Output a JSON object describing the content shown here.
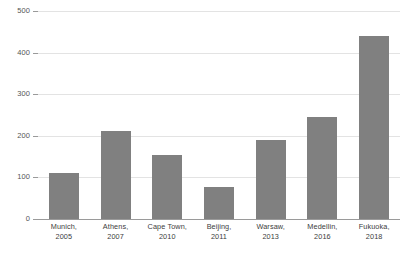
{
  "chart_data": {
    "type": "bar",
    "title": "",
    "subtitle": "",
    "xlabel": "",
    "ylabel": "",
    "ylim": [
      0,
      500
    ],
    "yticks": [
      0,
      100,
      200,
      300,
      400,
      500
    ],
    "ytick_labels": [
      "0",
      "100",
      "200",
      "300",
      "400",
      "500"
    ],
    "grid": true,
    "legend": false,
    "legend_position": "none",
    "bar_color": "#808080",
    "gridline_color": "#e3e3e3",
    "axis_color": "#9a9a9a",
    "categories": [
      "Munich, 2005",
      "Athens, 2007",
      "Cape Town, 2010",
      "Beijing, 2011",
      "Warsaw, 2013",
      "Medellin, 2016",
      "Fukuoka, 2018"
    ],
    "category_lines": [
      [
        "Munich,",
        "2005"
      ],
      [
        "Athens,",
        "2007"
      ],
      [
        "Cape Town,",
        "2010"
      ],
      [
        "Beijing,",
        "2011"
      ],
      [
        "Warsaw,",
        "2013"
      ],
      [
        "Medellin,",
        "2016"
      ],
      [
        "Fukuoka,",
        "2018"
      ]
    ],
    "values": [
      110,
      212,
      153,
      78,
      190,
      245,
      440
    ]
  }
}
